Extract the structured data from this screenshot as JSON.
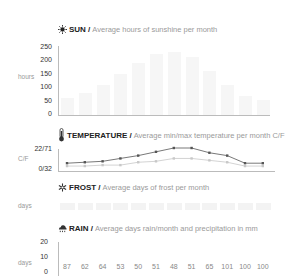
{
  "sun": {
    "icon": "sun-icon",
    "title": "SUN /",
    "subtitle": "Average hours of sunshine per month",
    "unit": "hours",
    "ticks": [
      "250",
      "200",
      "150",
      "100",
      "50",
      "0"
    ]
  },
  "temperature": {
    "icon": "thermometer-icon",
    "title": "TEMPERATURE /",
    "subtitle": "Average min/max temperature per month C/F",
    "unit": "C/F",
    "ticks": [
      "22/71",
      "0/32"
    ]
  },
  "frost": {
    "icon": "snowflake-icon",
    "title": "FROST /",
    "subtitle": "Average days of frost per month",
    "unit": "days"
  },
  "rain": {
    "icon": "rain-cloud-icon",
    "title": "RAIN /",
    "subtitle": "Average days rain/month and precipitation in mm",
    "unit": "days",
    "ticks": [
      "20",
      "10",
      "0"
    ],
    "precip_labels": [
      "87",
      "62",
      "64",
      "53",
      "50",
      "51",
      "48",
      "51",
      "65",
      "101",
      "100",
      "100"
    ]
  },
  "chart_data": [
    {
      "type": "bar",
      "title": "SUN / Average hours of sunshine per month",
      "ylabel": "hours",
      "ylim": [
        0,
        250
      ],
      "yticks": [
        0,
        50,
        100,
        150,
        200,
        250
      ],
      "categories": [
        "Jan",
        "Feb",
        "Mar",
        "Apr",
        "May",
        "Jun",
        "Jul",
        "Aug",
        "Sep",
        "Oct",
        "Nov",
        "Dec"
      ],
      "values": [
        60,
        80,
        110,
        150,
        190,
        220,
        230,
        210,
        160,
        110,
        70,
        55
      ]
    },
    {
      "type": "line",
      "title": "TEMPERATURE / Average min/max temperature per month C/F",
      "ylabel": "C/F",
      "ytick_labels": [
        "0/32",
        "22/71"
      ],
      "categories": [
        "Jan",
        "Feb",
        "Mar",
        "Apr",
        "May",
        "Jun",
        "Jul",
        "Aug",
        "Sep",
        "Oct",
        "Nov",
        "Dec"
      ],
      "series": [
        {
          "name": "max",
          "values": [
            4,
            5,
            6,
            9,
            12,
            16,
            20,
            20,
            15,
            12,
            4,
            4
          ]
        },
        {
          "name": "min",
          "values": [
            1,
            1,
            2,
            2,
            5,
            6,
            9,
            9,
            7,
            5,
            1,
            1
          ]
        }
      ]
    },
    {
      "type": "bar",
      "title": "FROST / Average days of frost per month",
      "ylabel": "days",
      "categories": [
        "Jan",
        "Feb",
        "Mar",
        "Apr",
        "May",
        "Jun",
        "Jul",
        "Aug",
        "Sep",
        "Oct",
        "Nov",
        "Dec"
      ],
      "values": [
        0,
        0,
        0,
        0,
        0,
        0,
        0,
        0,
        0,
        0,
        0,
        0
      ]
    },
    {
      "type": "bar",
      "title": "RAIN / Average days rain/month and precipitation in mm",
      "ylabel": "days",
      "ylim": [
        0,
        20
      ],
      "yticks": [
        0,
        10,
        20
      ],
      "categories": [
        "Jan",
        "Feb",
        "Mar",
        "Apr",
        "May",
        "Jun",
        "Jul",
        "Aug",
        "Sep",
        "Oct",
        "Nov",
        "Dec"
      ],
      "precipitation_mm": [
        87,
        62,
        64,
        53,
        50,
        51,
        48,
        51,
        65,
        101,
        100,
        100
      ]
    }
  ]
}
